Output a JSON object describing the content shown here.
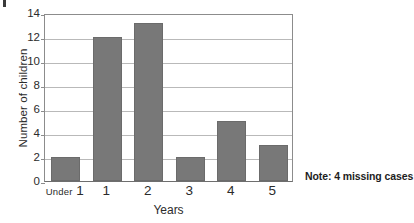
{
  "chart_data": {
    "type": "bar",
    "title": "",
    "subtitle": "",
    "categories": [
      "Under 1",
      "1",
      "2",
      "3",
      "4",
      "5"
    ],
    "category_primary": [
      "1",
      "1",
      "2",
      "3",
      "4",
      "5"
    ],
    "category_prefix": [
      "Under",
      "",
      "",
      "",
      "",
      ""
    ],
    "values": [
      2,
      12,
      13.2,
      2,
      5,
      3
    ],
    "xlabel": "Years",
    "ylabel": "Number of children",
    "ylim": [
      0,
      14
    ],
    "ytick_labels": [
      "0",
      "2",
      "4",
      "6",
      "8",
      "10",
      "12",
      "14"
    ],
    "ytick_values": [
      0,
      2,
      4,
      6,
      8,
      10,
      12,
      14
    ],
    "grid": true,
    "grid_axis": "y",
    "legend": false,
    "bar_color": "#787878",
    "bar_edge_color": "#6b6b6b",
    "grid_color": "#b9b9b9",
    "axis_color": "#8c8c8c",
    "background": "#ffffff",
    "annotations": [
      {
        "name": "missing-cases-note",
        "text": "Note: 4 missing cases",
        "position": "outside-right-bottom"
      }
    ]
  }
}
